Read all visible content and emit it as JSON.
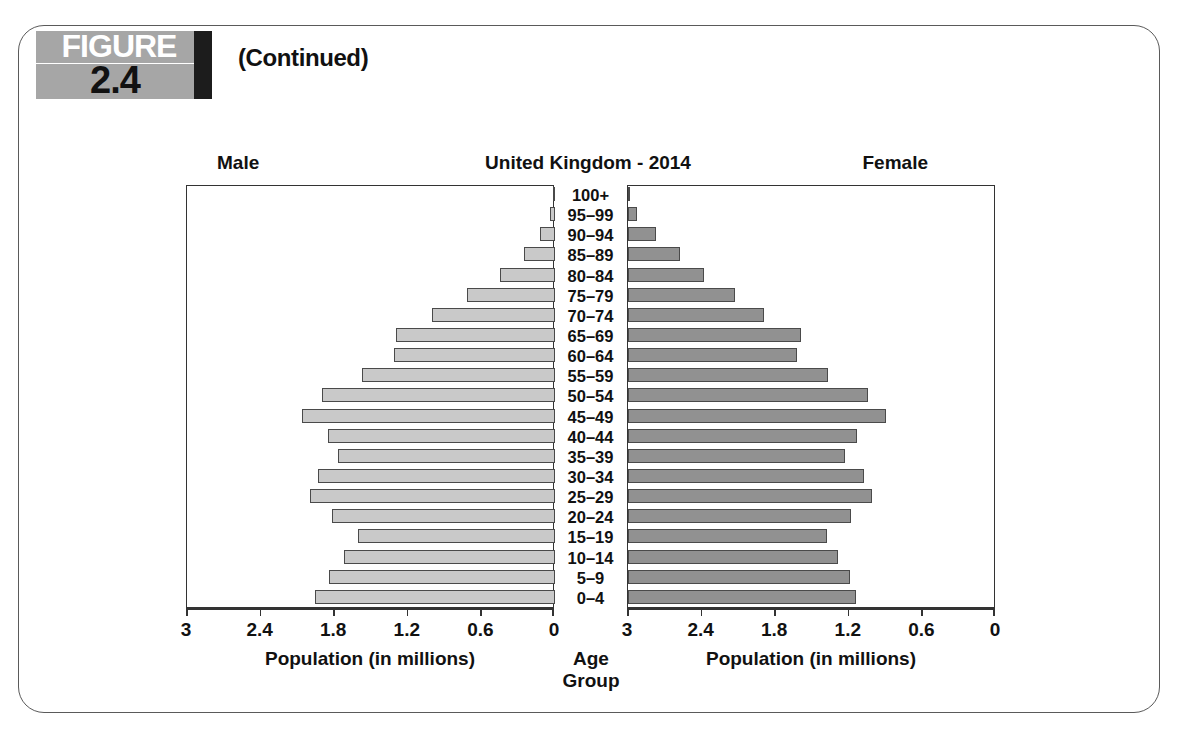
{
  "figure": {
    "badge_word": "FIGURE",
    "badge_number": "2.4",
    "continued_label": "(Continued)"
  },
  "chart_labels": {
    "male_side": "Male",
    "female_side": "Female",
    "title": "United Kingdom - 2014",
    "center_axis_title": "Age Group",
    "left_axis_title": "Population (in millions)",
    "right_axis_title": "Population (in millions)"
  },
  "colors": {
    "male_bar": "#c9c9c9",
    "female_bar": "#919191",
    "bar_border": "#4a4a4a",
    "frame_border": "#5a5a5a",
    "badge_gray": "#a6a6a6",
    "badge_black": "#1c1c1c"
  },
  "chart_data": {
    "type": "bar",
    "subtype": "population-pyramid",
    "title": "United Kingdom - 2014",
    "xlabel": "Population (in millions)",
    "ylabel": "Age Group",
    "grid": false,
    "legend_position": "top-outside",
    "axis_ticks": [
      "3",
      "2.4",
      "1.8",
      "1.2",
      "0.6",
      "0"
    ],
    "tick_values": [
      3,
      2.4,
      1.8,
      1.2,
      0.6,
      0
    ],
    "xlim": [
      0,
      3
    ],
    "categories": [
      "100+",
      "95–99",
      "90–94",
      "85–89",
      "80–84",
      "75–79",
      "70–74",
      "65–69",
      "60–64",
      "55–59",
      "50–54",
      "45–49",
      "40–44",
      "35–39",
      "30–34",
      "25–29",
      "20–24",
      "15–19",
      "10–14",
      "5–9",
      "0–4"
    ],
    "series": [
      {
        "name": "Male",
        "side": "left",
        "values": [
          0.01,
          0.04,
          0.12,
          0.25,
          0.45,
          0.72,
          1.0,
          1.3,
          1.31,
          1.57,
          1.9,
          2.06,
          1.85,
          1.77,
          1.93,
          2.0,
          1.82,
          1.61,
          1.72,
          1.84,
          1.96
        ]
      },
      {
        "name": "Female",
        "side": "right",
        "values": [
          0.02,
          0.07,
          0.23,
          0.42,
          0.62,
          0.87,
          1.11,
          1.41,
          1.38,
          1.63,
          1.96,
          2.1,
          1.87,
          1.77,
          1.92,
          1.99,
          1.82,
          1.62,
          1.71,
          1.81,
          1.86
        ]
      }
    ]
  }
}
